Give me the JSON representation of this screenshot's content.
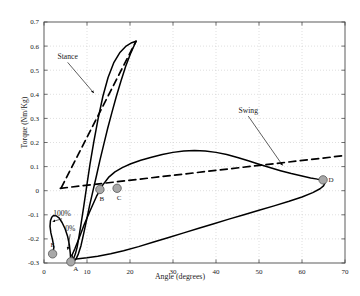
{
  "chart_data": {
    "type": "line",
    "title": "",
    "xlabel": "Angle (degrees)",
    "ylabel": "Torque (Nm/Kg)",
    "xlim": [
      0,
      70
    ],
    "ylim": [
      -0.3,
      0.7
    ],
    "xticks": [
      0,
      10,
      20,
      30,
      40,
      50,
      60,
      70
    ],
    "yticks": [
      -0.3,
      -0.2,
      -0.1,
      0,
      0.1,
      0.2,
      0.3,
      0.4,
      0.5,
      0.6,
      0.7
    ],
    "xtick_labels": [
      "0",
      "10",
      "20",
      "30",
      "40",
      "50",
      "60",
      "70"
    ],
    "ytick_labels": [
      "-0.3",
      "-0.2",
      "-0.1",
      "0",
      "0.1",
      "0.2",
      "0.3",
      "0.4",
      "0.5",
      "0.6",
      "0.7"
    ],
    "grid": true,
    "legend": "none",
    "series": [
      {
        "name": "stance-swing-loop-solid",
        "style": "solid",
        "color": "#000000",
        "points": [
          [
            2.0,
            -0.262
          ],
          [
            2.3,
            -0.235
          ],
          [
            2.0,
            -0.205
          ],
          [
            1.6,
            -0.175
          ],
          [
            1.4,
            -0.148
          ],
          [
            1.5,
            -0.125
          ],
          [
            1.8,
            -0.11
          ],
          [
            2.2,
            -0.103
          ],
          [
            2.8,
            -0.104
          ],
          [
            3.5,
            -0.113
          ],
          [
            4.2,
            -0.132
          ],
          [
            4.9,
            -0.158
          ],
          [
            5.5,
            -0.19
          ],
          [
            5.9,
            -0.225
          ],
          [
            6.1,
            -0.258
          ],
          [
            6.2,
            -0.282
          ],
          [
            6.25,
            -0.295
          ],
          [
            6.5,
            -0.293
          ],
          [
            6.9,
            -0.28
          ],
          [
            7.3,
            -0.262
          ],
          [
            7.7,
            -0.235
          ],
          [
            8.1,
            -0.195
          ],
          [
            8.6,
            -0.14
          ],
          [
            9.2,
            -0.07
          ],
          [
            9.9,
            0.015
          ],
          [
            10.7,
            0.11
          ],
          [
            11.6,
            0.205
          ],
          [
            12.6,
            0.3
          ],
          [
            13.7,
            0.392
          ],
          [
            14.9,
            0.47
          ],
          [
            16.2,
            0.53
          ],
          [
            17.6,
            0.572
          ],
          [
            19.1,
            0.6
          ],
          [
            20.4,
            0.614
          ],
          [
            21.4,
            0.62
          ]
        ]
      },
      {
        "name": "stance-return-solid",
        "style": "solid",
        "color": "#000000",
        "points": [
          [
            21.4,
            0.62
          ],
          [
            20.2,
            0.572
          ],
          [
            19.0,
            0.516
          ],
          [
            17.9,
            0.455
          ],
          [
            16.8,
            0.39
          ],
          [
            15.8,
            0.325
          ],
          [
            14.8,
            0.258
          ],
          [
            13.9,
            0.192
          ],
          [
            13.0,
            0.126
          ],
          [
            12.2,
            0.062
          ],
          [
            11.4,
            0.0
          ],
          [
            10.6,
            -0.062
          ],
          [
            9.9,
            -0.122
          ],
          [
            9.2,
            -0.18
          ],
          [
            8.6,
            -0.228
          ],
          [
            8.0,
            -0.262
          ],
          [
            7.5,
            -0.282
          ],
          [
            7.1,
            -0.29
          ],
          [
            6.8,
            -0.288
          ],
          [
            6.6,
            -0.278
          ],
          [
            6.5,
            -0.268
          ]
        ]
      },
      {
        "name": "swing-loop-upper",
        "style": "solid",
        "color": "#000000",
        "points": [
          [
            6.5,
            -0.268
          ],
          [
            7.2,
            -0.24
          ],
          [
            8.2,
            -0.195
          ],
          [
            9.4,
            -0.138
          ],
          [
            10.8,
            -0.08
          ],
          [
            12.2,
            -0.024
          ],
          [
            13.6,
            0.022
          ],
          [
            15.0,
            0.055
          ],
          [
            16.5,
            0.078
          ],
          [
            18.2,
            0.096
          ],
          [
            20.2,
            0.112
          ],
          [
            22.5,
            0.126
          ],
          [
            25.0,
            0.139
          ],
          [
            27.5,
            0.15
          ],
          [
            30.0,
            0.159
          ],
          [
            32.5,
            0.165
          ],
          [
            35.0,
            0.167
          ],
          [
            37.5,
            0.165
          ],
          [
            40.0,
            0.159
          ],
          [
            42.5,
            0.15
          ],
          [
            45.0,
            0.138
          ],
          [
            47.5,
            0.124
          ],
          [
            50.0,
            0.11
          ],
          [
            52.5,
            0.096
          ],
          [
            55.0,
            0.083
          ],
          [
            57.5,
            0.071
          ],
          [
            60.0,
            0.061
          ],
          [
            62.0,
            0.053
          ],
          [
            63.6,
            0.048
          ],
          [
            64.7,
            0.046
          ]
        ]
      },
      {
        "name": "swing-loop-lower",
        "style": "solid",
        "color": "#000000",
        "points": [
          [
            64.7,
            0.046
          ],
          [
            65.2,
            0.04
          ],
          [
            65.3,
            0.03
          ],
          [
            65.0,
            0.02
          ],
          [
            64.2,
            0.008
          ],
          [
            62.5,
            -0.008
          ],
          [
            60.0,
            -0.026
          ],
          [
            57.0,
            -0.044
          ],
          [
            53.5,
            -0.063
          ],
          [
            50.0,
            -0.081
          ],
          [
            46.5,
            -0.1
          ],
          [
            43.0,
            -0.118
          ],
          [
            39.5,
            -0.137
          ],
          [
            36.0,
            -0.156
          ],
          [
            32.5,
            -0.175
          ],
          [
            29.0,
            -0.194
          ],
          [
            25.5,
            -0.213
          ],
          [
            22.0,
            -0.232
          ],
          [
            18.5,
            -0.249
          ],
          [
            15.5,
            -0.262
          ],
          [
            12.5,
            -0.272
          ],
          [
            10.0,
            -0.278
          ],
          [
            8.0,
            -0.282
          ],
          [
            6.8,
            -0.285
          ],
          [
            6.25,
            -0.295
          ]
        ]
      },
      {
        "name": "stance-dashed-line",
        "style": "dashed",
        "color": "#000000",
        "points": [
          [
            4.0,
            0.012
          ],
          [
            21.4,
            0.62
          ]
        ]
      },
      {
        "name": "swing-dashed-line",
        "style": "dashed",
        "color": "#000000",
        "points": [
          [
            3.8,
            0.01
          ],
          [
            70.0,
            0.146
          ]
        ]
      }
    ],
    "markers": [
      {
        "label": "A",
        "x": 6.25,
        "y": -0.295,
        "label_dx": 5,
        "label_dy": 9
      },
      {
        "label": "B",
        "x": 13.0,
        "y": 0.005,
        "label_dx": 2,
        "label_dy": 12
      },
      {
        "label": "C",
        "x": 17.0,
        "y": 0.01,
        "label_dx": 2,
        "label_dy": 12
      },
      {
        "label": "D",
        "x": 64.9,
        "y": 0.045,
        "label_dx": 8,
        "label_dy": 2
      },
      {
        "label": "E",
        "x": 2.0,
        "y": -0.262,
        "label_dx": 0,
        "label_dy": -7
      }
    ],
    "annotations": [
      {
        "text": "Stance",
        "x": 5.5,
        "y": 0.545,
        "arrow_to_x": 11.6,
        "arrow_to_y": 0.405
      },
      {
        "text": "Swing",
        "x": 47.5,
        "y": 0.322,
        "arrow_to_x": 55.5,
        "arrow_to_y": 0.105
      },
      {
        "text": "100%",
        "x": 4.2,
        "y": -0.104,
        "arrow_to_x": 2.0,
        "arrow_to_y": -0.128
      },
      {
        "text": "0%",
        "x": 6.1,
        "y": -0.168,
        "arrow_to_x": 5.5,
        "arrow_to_y": -0.245
      }
    ],
    "marker_style": {
      "fill": "#a8a8a8",
      "stroke": "#555555",
      "radius": 4.2
    }
  }
}
